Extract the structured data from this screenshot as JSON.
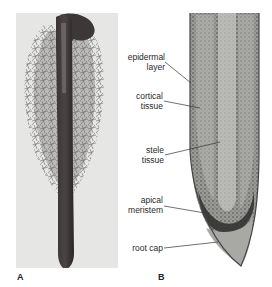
{
  "figure": {
    "panels": [
      {
        "letter": "A",
        "description": "Photograph of whole root with dense root hairs along upper portion and smooth tapering tip"
      },
      {
        "letter": "B",
        "description": "Longitudinal section of root tip"
      }
    ],
    "labels": {
      "epidermal_1": "epidermal",
      "epidermal_2": "layer",
      "cortical_1": "cortical",
      "cortical_2": "tissue",
      "stele_1": "stele",
      "stele_2": "tissue",
      "apical_1": "apical",
      "apical_2": "meristem",
      "rootcap": "root cap"
    },
    "colors": {
      "panel_a_bg": "#e6e6e4",
      "root_dark": "#2e2a2a",
      "tissue_mid": "#8a8a86",
      "line": "#333333"
    }
  }
}
